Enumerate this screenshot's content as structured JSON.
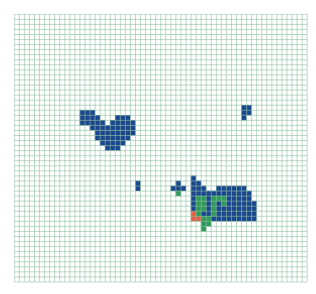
{
  "grid": {
    "cols": 58,
    "rows": 53,
    "cell_px": 5.05,
    "line_color": "#8fbf9f",
    "background": "#ffffff"
  },
  "palette": {
    "B": "#1a4690",
    "G": "#2e9a5a",
    "R": "#e0604a"
  },
  "regions": [
    {
      "name": "left-blob",
      "color": "B",
      "cells": [
        [
          19,
          13
        ],
        [
          19,
          14
        ],
        [
          19,
          15
        ],
        [
          20,
          13
        ],
        [
          20,
          14
        ],
        [
          20,
          15
        ],
        [
          20,
          16
        ],
        [
          20,
          20
        ],
        [
          20,
          21
        ],
        [
          20,
          22
        ],
        [
          21,
          13
        ],
        [
          21,
          14
        ],
        [
          21,
          15
        ],
        [
          21,
          16
        ],
        [
          21,
          17
        ],
        [
          21,
          19
        ],
        [
          21,
          20
        ],
        [
          21,
          21
        ],
        [
          21,
          22
        ],
        [
          21,
          23
        ],
        [
          22,
          15
        ],
        [
          22,
          16
        ],
        [
          22,
          17
        ],
        [
          22,
          18
        ],
        [
          22,
          19
        ],
        [
          22,
          20
        ],
        [
          22,
          21
        ],
        [
          22,
          22
        ],
        [
          22,
          23
        ],
        [
          23,
          16
        ],
        [
          23,
          17
        ],
        [
          23,
          18
        ],
        [
          23,
          19
        ],
        [
          23,
          20
        ],
        [
          23,
          21
        ],
        [
          23,
          22
        ],
        [
          23,
          23
        ],
        [
          24,
          16
        ],
        [
          24,
          17
        ],
        [
          24,
          18
        ],
        [
          24,
          19
        ],
        [
          24,
          20
        ],
        [
          24,
          21
        ],
        [
          24,
          22
        ],
        [
          25,
          17
        ],
        [
          25,
          18
        ],
        [
          25,
          19
        ],
        [
          25,
          20
        ],
        [
          25,
          21
        ],
        [
          26,
          18
        ],
        [
          26,
          19
        ],
        [
          26,
          20
        ]
      ]
    },
    {
      "name": "top-right-speck",
      "color": "B",
      "cells": [
        [
          18,
          45
        ],
        [
          18,
          46
        ],
        [
          19,
          45
        ],
        [
          19,
          46
        ],
        [
          20,
          45
        ]
      ]
    },
    {
      "name": "single-square",
      "color": "B",
      "cells": [
        [
          33,
          24
        ],
        [
          34,
          24
        ]
      ]
    },
    {
      "name": "small-cluster",
      "color": "B",
      "cells": [
        [
          33,
          32
        ],
        [
          34,
          31
        ],
        [
          34,
          32
        ],
        [
          34,
          33
        ]
      ]
    },
    {
      "name": "small-cluster-green",
      "color": "G",
      "cells": [
        [
          35,
          32
        ]
      ]
    },
    {
      "name": "right-blob",
      "color": "B",
      "cells": [
        [
          32,
          35
        ],
        [
          33,
          35
        ],
        [
          33,
          36
        ],
        [
          34,
          35
        ],
        [
          34,
          36
        ],
        [
          34,
          37
        ],
        [
          34,
          40
        ],
        [
          34,
          41
        ],
        [
          34,
          42
        ],
        [
          34,
          43
        ],
        [
          34,
          44
        ],
        [
          34,
          45
        ],
        [
          35,
          35
        ],
        [
          35,
          36
        ],
        [
          35,
          37
        ],
        [
          35,
          38
        ],
        [
          35,
          39
        ],
        [
          35,
          40
        ],
        [
          35,
          41
        ],
        [
          35,
          42
        ],
        [
          35,
          43
        ],
        [
          35,
          44
        ],
        [
          35,
          45
        ],
        [
          35,
          46
        ],
        [
          36,
          35
        ],
        [
          36,
          38
        ],
        [
          36,
          42
        ],
        [
          36,
          43
        ],
        [
          36,
          44
        ],
        [
          36,
          45
        ],
        [
          36,
          46
        ],
        [
          37,
          35
        ],
        [
          37,
          38
        ],
        [
          37,
          40
        ],
        [
          37,
          42
        ],
        [
          37,
          43
        ],
        [
          37,
          44
        ],
        [
          37,
          45
        ],
        [
          37,
          46
        ],
        [
          37,
          47
        ],
        [
          38,
          35
        ],
        [
          38,
          38
        ],
        [
          38,
          40
        ],
        [
          38,
          41
        ],
        [
          38,
          42
        ],
        [
          38,
          43
        ],
        [
          38,
          44
        ],
        [
          38,
          45
        ],
        [
          38,
          46
        ],
        [
          38,
          47
        ],
        [
          39,
          37
        ],
        [
          39,
          38
        ],
        [
          39,
          40
        ],
        [
          39,
          41
        ],
        [
          39,
          42
        ],
        [
          39,
          43
        ],
        [
          39,
          44
        ],
        [
          39,
          45
        ],
        [
          39,
          46
        ],
        [
          39,
          47
        ],
        [
          40,
          39
        ],
        [
          40,
          40
        ],
        [
          40,
          41
        ],
        [
          40,
          42
        ],
        [
          40,
          43
        ],
        [
          40,
          44
        ],
        [
          40,
          45
        ],
        [
          40,
          46
        ],
        [
          40,
          47
        ]
      ]
    },
    {
      "name": "right-blob-green",
      "color": "G",
      "cells": [
        [
          36,
          36
        ],
        [
          36,
          37
        ],
        [
          36,
          39
        ],
        [
          36,
          40
        ],
        [
          36,
          41
        ],
        [
          37,
          36
        ],
        [
          37,
          37
        ],
        [
          37,
          39
        ],
        [
          37,
          41
        ],
        [
          38,
          36
        ],
        [
          38,
          37
        ],
        [
          38,
          39
        ],
        [
          39,
          36
        ],
        [
          39,
          39
        ],
        [
          40,
          37
        ],
        [
          40,
          38
        ],
        [
          41,
          37
        ],
        [
          41,
          38
        ],
        [
          42,
          37
        ]
      ]
    },
    {
      "name": "right-blob-red",
      "color": "R",
      "cells": [
        [
          39,
          35
        ],
        [
          40,
          35
        ],
        [
          40,
          36
        ]
      ]
    }
  ]
}
